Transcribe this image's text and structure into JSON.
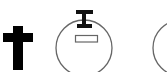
{
  "symbols": [
    {
      "name": "cross",
      "label": "Latin cross",
      "color": "#000000"
    },
    {
      "name": "circle-with-marker",
      "label": "Circle with I-beam marker and bar",
      "stroke": "#666666",
      "marker_color": "#111111"
    },
    {
      "name": "partial-circle",
      "label": "Partially visible circle",
      "stroke": "#666666"
    }
  ],
  "colors": {
    "background": "#ffffff",
    "cross": "#000000",
    "outline": "#666666"
  }
}
